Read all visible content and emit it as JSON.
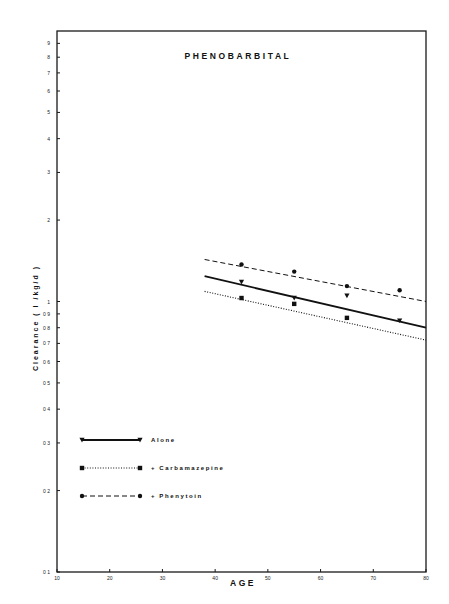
{
  "chart_data": {
    "type": "line",
    "title": "PHENOBARBITAL",
    "xlabel": "AGE",
    "ylabel": "Clearance ( l /kg/d )",
    "xlim": [
      10,
      80
    ],
    "ylim": [
      0.1,
      10
    ],
    "yscale": "log",
    "grid": false,
    "x_ticks": [
      10,
      20,
      30,
      40,
      50,
      60,
      70,
      80
    ],
    "x_tick_labels": [
      "10",
      "20",
      "30",
      "40",
      "50",
      "60",
      "70",
      "80"
    ],
    "y_ticks": [
      0.1,
      0.2,
      0.3,
      0.4,
      0.5,
      0.6,
      0.7,
      0.8,
      0.9,
      1,
      2,
      3,
      4,
      5,
      6,
      7,
      8,
      9
    ],
    "y_tick_labels": [
      "0 1",
      "0 2",
      "0 3",
      "0 4",
      "0 5",
      "0 6",
      "0 7",
      "0 8",
      "0 9",
      "1",
      "2",
      "3",
      "4",
      "5",
      "6",
      "7",
      "8",
      "9"
    ],
    "legend_position": "bottom-left",
    "series": [
      {
        "name": "Alone",
        "legend_label": "Alone",
        "line_style": "solid",
        "marker": "triangle-down",
        "points": [
          {
            "x": 45,
            "y": 1.18
          },
          {
            "x": 55,
            "y": 1.03
          },
          {
            "x": 65,
            "y": 1.05
          },
          {
            "x": 75,
            "y": 0.85
          }
        ],
        "fit_line": {
          "x": [
            38,
            80
          ],
          "y": [
            1.24,
            0.8
          ]
        }
      },
      {
        "name": "+ Carbamazepine",
        "legend_label": "+ Carbamazepine",
        "line_style": "dotted",
        "marker": "square",
        "points": [
          {
            "x": 45,
            "y": 1.03
          },
          {
            "x": 55,
            "y": 0.98
          },
          {
            "x": 65,
            "y": 0.87
          }
        ],
        "fit_line": {
          "x": [
            38,
            80
          ],
          "y": [
            1.09,
            0.72
          ]
        }
      },
      {
        "name": "+ Phenytoin",
        "legend_label": "+ Phenytoin",
        "line_style": "dashed",
        "marker": "circle",
        "points": [
          {
            "x": 45,
            "y": 1.37
          },
          {
            "x": 55,
            "y": 1.29
          },
          {
            "x": 65,
            "y": 1.14
          },
          {
            "x": 75,
            "y": 1.1
          }
        ],
        "fit_line": {
          "x": [
            38,
            80
          ],
          "y": [
            1.43,
            1.0
          ]
        }
      }
    ]
  }
}
